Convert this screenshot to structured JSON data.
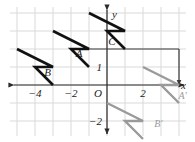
{
  "figure": {
    "type": "coordinate-plane-transformation",
    "background_color": "#ffffff",
    "grid_color": "#d9d9d9",
    "axis_color": "#2b2b2b",
    "preimage_color": "#111111",
    "image_color": "#9a9a9a",
    "construction_line_color": "#3a3a3a"
  },
  "axes": {
    "x_axis_label": "x",
    "y_axis_label": "y",
    "origin_label": "O",
    "x_tick_labels": [
      "−4",
      "−2",
      "2"
    ],
    "y_tick_labels": [
      "1",
      "−2"
    ],
    "x_range": [
      -5.4,
      5.0
    ],
    "y_range": [
      -3.2,
      3.6
    ],
    "grid_spacing_units": 1
  },
  "labels": {
    "preimage": [
      {
        "name": "A",
        "text": "A",
        "x": -1.55,
        "y": 1.55
      },
      {
        "name": "B",
        "text": "B",
        "x": -3.3,
        "y": 0.5
      },
      {
        "name": "C",
        "text": "C",
        "x": 0.28,
        "y": 2.25
      }
    ],
    "image": [
      {
        "name": "A-prime",
        "text": "A′",
        "x": 4.2,
        "y": -0.75
      },
      {
        "name": "B-prime",
        "text": "B′",
        "x": 2.85,
        "y": -2.35
      }
    ]
  },
  "chart_data": {
    "type": "scatter",
    "title": "",
    "xlabel": "x",
    "ylabel": "y",
    "xlim": [
      -5.4,
      5.0
    ],
    "ylim": [
      -3.2,
      3.6
    ],
    "grid": true,
    "points": [
      {
        "label": "A",
        "x": -1,
        "y": 2
      },
      {
        "label": "B",
        "x": -3,
        "y": 1
      },
      {
        "label": "C",
        "x": 0,
        "y": 3
      },
      {
        "label": "A'",
        "x": 4,
        "y": 0
      },
      {
        "label": "B'",
        "x": 3,
        "y": -2
      }
    ],
    "preimage_polygons": [
      {
        "name": "arrow-left",
        "points": "-5,2 -3,1 -4,1 -3,0"
      },
      {
        "name": "arrow-mid",
        "points": "-3,3 -1,2 -2,2 -1,1"
      },
      {
        "name": "arrow-right",
        "points": "-1,4 1,3 0,3 1,2"
      }
    ],
    "image_polygons": [
      {
        "name": "arrow-img-low",
        "points": "0,-1 2,-2 1,-2 2,-3"
      },
      {
        "name": "arrow-img-high",
        "points": "2,1 4,0 3,0 4,-1"
      }
    ],
    "construction_lines": [
      {
        "name": "horizontal-from-A",
        "x1": -1,
        "y1": 2,
        "x2": 4,
        "y2": 2
      },
      {
        "name": "vertical-to-A-prime",
        "x1": 4,
        "y1": 2,
        "x2": 4,
        "y2": 0
      }
    ]
  }
}
